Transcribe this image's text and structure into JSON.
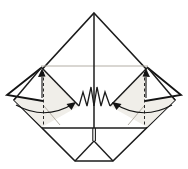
{
  "figure": {
    "kind": "origami-step-diagram",
    "canvas": {
      "width": 188,
      "height": 169,
      "background": "#ffffff"
    },
    "colors": {
      "line": "#1c1c1c",
      "heavy": "#141414",
      "crease": "#b3aea5",
      "shade": "#f0eee9",
      "paper": "#ffffff"
    },
    "elements": [
      {
        "name": "paper-diamond-outline",
        "kind": "polygon",
        "points": [
          [
            94,
            13
          ],
          [
            175,
            100
          ],
          [
            113,
            161
          ],
          [
            75,
            161
          ],
          [
            14,
            100
          ]
        ],
        "fill": "#ffffff",
        "stroke": "#1c1c1c",
        "width": 1.6
      },
      {
        "name": "shaded-layer-left",
        "kind": "polygon",
        "points": [
          [
            41,
            67
          ],
          [
            79,
            106
          ],
          [
            42,
            127
          ],
          [
            14,
            100
          ]
        ],
        "fill": "#f0eee9",
        "stroke": "none",
        "width": 0
      },
      {
        "name": "shaded-layer-right",
        "kind": "polygon",
        "points": [
          [
            148,
            67
          ],
          [
            110,
            106
          ],
          [
            147,
            127
          ],
          [
            175,
            100
          ]
        ],
        "fill": "#f0eee9",
        "stroke": "none",
        "width": 0
      },
      {
        "name": "hidden-edge-horizontal-crease",
        "kind": "line",
        "x1": 41,
        "y1": 66,
        "x2": 148,
        "y2": 66,
        "stroke": "#b3aea5",
        "width": 1
      },
      {
        "name": "ghost-crease-left",
        "kind": "line",
        "x1": 44,
        "y1": 106,
        "x2": 60,
        "y2": 125,
        "stroke": "#b3aea5",
        "width": 1
      },
      {
        "name": "ghost-crease-right",
        "kind": "line",
        "x1": 144,
        "y1": 106,
        "x2": 128,
        "y2": 125,
        "stroke": "#b3aea5",
        "width": 1
      },
      {
        "name": "layer-diagonal-left",
        "kind": "line",
        "x1": 41,
        "y1": 67,
        "x2": 79,
        "y2": 106,
        "stroke": "#1c1c1c",
        "width": 1.5
      },
      {
        "name": "layer-diagonal-right",
        "kind": "line",
        "x1": 148,
        "y1": 67,
        "x2": 110,
        "y2": 106,
        "stroke": "#1c1c1c",
        "width": 1.5
      },
      {
        "name": "pleat-zigzag-left",
        "kind": "polyline",
        "points": [
          [
            79,
            106
          ],
          [
            83,
            92
          ],
          [
            87,
            106
          ],
          [
            91,
            87
          ],
          [
            94,
            106
          ]
        ],
        "fill": "#ffffff",
        "stroke": "#1c1c1c",
        "width": 1.3
      },
      {
        "name": "pleat-zigzag-right",
        "kind": "polyline",
        "points": [
          [
            94,
            106
          ],
          [
            97,
            87
          ],
          [
            101,
            106
          ],
          [
            105,
            92
          ],
          [
            110,
            106
          ]
        ],
        "fill": "#ffffff",
        "stroke": "#1c1c1c",
        "width": 1.3
      },
      {
        "name": "center-vertical-edge",
        "kind": "line",
        "x1": 94,
        "y1": 13,
        "x2": 94,
        "y2": 128,
        "stroke": "#1c1c1c",
        "width": 1.5
      },
      {
        "name": "front-layer-bottom-edge",
        "kind": "line",
        "x1": 42,
        "y1": 128,
        "x2": 147,
        "y2": 128,
        "stroke": "#1c1c1c",
        "width": 1.5
      },
      {
        "name": "center-slit-left",
        "kind": "line",
        "x1": 92.8,
        "y1": 128,
        "x2": 92.8,
        "y2": 141,
        "stroke": "#1c1c1c",
        "width": 1.1
      },
      {
        "name": "center-slit-right",
        "kind": "line",
        "x1": 95.4,
        "y1": 128,
        "x2": 95.4,
        "y2": 141,
        "stroke": "#1c1c1c",
        "width": 1.1
      },
      {
        "name": "bottom-pocket-diagonal-left",
        "kind": "line",
        "x1": 94,
        "y1": 141,
        "x2": 75,
        "y2": 161,
        "stroke": "#1c1c1c",
        "width": 1.4
      },
      {
        "name": "bottom-pocket-diagonal-right",
        "kind": "line",
        "x1": 94,
        "y1": 141,
        "x2": 113,
        "y2": 161,
        "stroke": "#1c1c1c",
        "width": 1.4
      },
      {
        "name": "flap-left",
        "kind": "polyline",
        "points": [
          [
            41,
            68
          ],
          [
            7,
            95
          ],
          [
            43,
            101
          ]
        ],
        "fill": "#ffffff",
        "stroke": "#141414",
        "width": 1.8
      },
      {
        "name": "flap-right",
        "kind": "polyline",
        "points": [
          [
            148,
            68
          ],
          [
            181,
            95
          ],
          [
            145,
            101
          ]
        ],
        "fill": "#ffffff",
        "stroke": "#141414",
        "width": 1.8
      },
      {
        "name": "paper-edge-over-flap-left",
        "kind": "line",
        "x1": 41,
        "y1": 68,
        "x2": 14,
        "y2": 100,
        "stroke": "#1c1c1c",
        "width": 1.5
      },
      {
        "name": "paper-edge-over-flap-right",
        "kind": "line",
        "x1": 148,
        "y1": 68,
        "x2": 175,
        "y2": 100,
        "stroke": "#1c1c1c",
        "width": 1.5
      },
      {
        "name": "valley-fold-dashed-left",
        "kind": "line",
        "x1": 43.5,
        "y1": 72,
        "x2": 43.5,
        "y2": 127,
        "stroke": "#2a2a2a",
        "width": 1,
        "dash": "3,2.5"
      },
      {
        "name": "valley-fold-dashed-right",
        "kind": "line",
        "x1": 144.5,
        "y1": 72,
        "x2": 144.5,
        "y2": 127,
        "stroke": "#2a2a2a",
        "width": 1,
        "dash": "3,2.5"
      },
      {
        "name": "small-arrow-shaft-left",
        "kind": "line",
        "x1": 42,
        "y1": 77,
        "x2": 42,
        "y2": 98,
        "stroke": "#141414",
        "width": 1.1
      },
      {
        "name": "small-arrow-shaft-right",
        "kind": "line",
        "x1": 146,
        "y1": 77,
        "x2": 146,
        "y2": 98,
        "stroke": "#141414",
        "width": 1.1
      },
      {
        "name": "small-arrowhead-left",
        "kind": "polygon",
        "points": [
          [
            42,
            68.5
          ],
          [
            38,
            77
          ],
          [
            45.5,
            76.5
          ]
        ],
        "fill": "#141414",
        "stroke": "none",
        "width": 0
      },
      {
        "name": "small-arrowhead-right",
        "kind": "polygon",
        "points": [
          [
            146,
            68.5
          ],
          [
            142.5,
            76.5
          ],
          [
            150,
            77
          ]
        ],
        "fill": "#141414",
        "stroke": "none",
        "width": 0
      },
      {
        "name": "fold-arrow-curve-left",
        "kind": "path",
        "d": "M 16 105 Q 45 121 73 104",
        "fill": "none",
        "stroke": "#141414",
        "width": 1.2
      },
      {
        "name": "fold-arrow-curve-right",
        "kind": "path",
        "d": "M 172 105 Q 143 121 115 104",
        "fill": "none",
        "stroke": "#141414",
        "width": 1.2
      },
      {
        "name": "fold-arrowhead-left",
        "kind": "polygon",
        "points": [
          [
            76,
            102
          ],
          [
            66.5,
            104
          ],
          [
            71.5,
            110
          ]
        ],
        "fill": "#141414",
        "stroke": "none",
        "width": 0
      },
      {
        "name": "fold-arrowhead-right",
        "kind": "polygon",
        "points": [
          [
            112,
            102
          ],
          [
            121.5,
            104
          ],
          [
            116.5,
            110
          ]
        ],
        "fill": "#141414",
        "stroke": "none",
        "width": 0
      }
    ]
  }
}
